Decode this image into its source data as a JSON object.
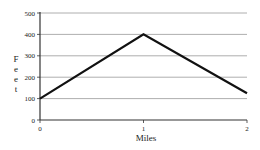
{
  "chart_data": {
    "type": "line",
    "title": "",
    "xlabel": "Miles",
    "ylabel": "Feet",
    "x": [
      0,
      1,
      2
    ],
    "values": [
      100,
      400,
      125
    ],
    "series": [
      {
        "name": "Elevation",
        "x": [
          0,
          1,
          2
        ],
        "values": [
          100,
          400,
          125
        ]
      }
    ],
    "xticks": [
      "0",
      "1",
      "2"
    ],
    "yticks": [
      "0",
      "100",
      "200",
      "300",
      "400",
      "500"
    ],
    "xlim": [
      0,
      2
    ],
    "ylim": [
      0,
      500
    ],
    "grid": "horizontal",
    "legend": "none"
  },
  "colors": {
    "line": "#111111",
    "grid": "#999999",
    "axis": "#333333"
  }
}
